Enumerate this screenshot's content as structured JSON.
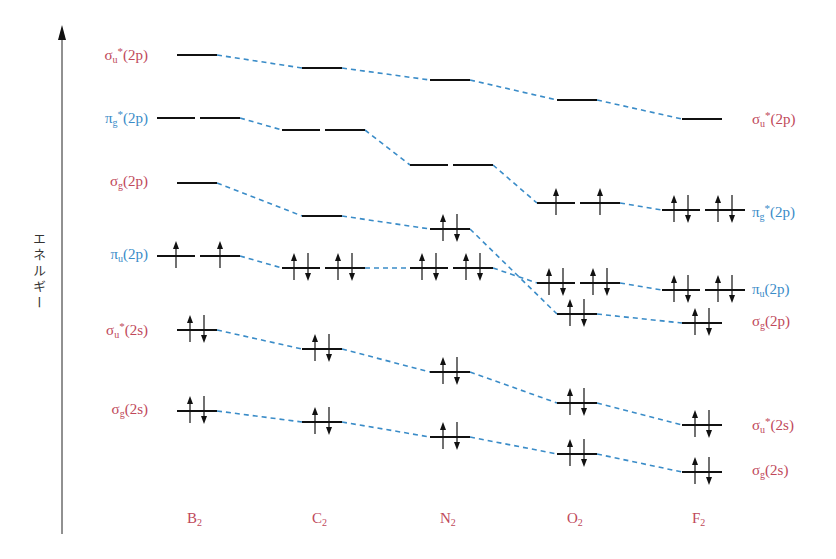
{
  "diagram": {
    "type": "molecular-orbital-energy-diagram",
    "y_axis_label": "エネルギー",
    "colors": {
      "sigma_label": "#c0485a",
      "pi_label": "#3a8cc8",
      "connector": "#3a8cc8",
      "level": "#111111"
    },
    "left_labels": [
      {
        "sym": "σ",
        "sub": "u",
        "star": "*",
        "orb": "(2p)",
        "color": "red",
        "y": 55
      },
      {
        "sym": "π",
        "sub": "g",
        "star": "*",
        "orb": "(2p)",
        "color": "blue",
        "y": 118
      },
      {
        "sym": "σ",
        "sub": "g",
        "star": "",
        "orb": "(2p)",
        "color": "red",
        "y": 183
      },
      {
        "sym": "π",
        "sub": "u",
        "star": "",
        "orb": "(2p)",
        "color": "blue",
        "y": 256
      },
      {
        "sym": "σ",
        "sub": "u",
        "star": "*",
        "orb": "(2s)",
        "color": "red",
        "y": 330
      },
      {
        "sym": "σ",
        "sub": "g",
        "star": "",
        "orb": "(2s)",
        "color": "red",
        "y": 411
      }
    ],
    "right_labels": [
      {
        "sym": "σ",
        "sub": "u",
        "star": "*",
        "orb": "(2p)",
        "color": "red",
        "y": 119
      },
      {
        "sym": "π",
        "sub": "g",
        "star": "*",
        "orb": "(2p)",
        "color": "blue",
        "y": 212
      },
      {
        "sym": "π",
        "sub": "u",
        "star": "",
        "orb": "(2p)",
        "color": "blue",
        "y": 291
      },
      {
        "sym": "σ",
        "sub": "g",
        "star": "",
        "orb": "(2p)",
        "color": "red",
        "y": 323
      },
      {
        "sym": "σ",
        "sub": "u",
        "star": "*",
        "orb": "(2s)",
        "color": "red",
        "y": 425
      },
      {
        "sym": "σ",
        "sub": "g",
        "star": "",
        "orb": "(2s)",
        "color": "red",
        "y": 472
      }
    ],
    "molecules": [
      {
        "name": "B",
        "sub": "2",
        "cx": 197,
        "levels": {
          "sigma_u_star_2p": {
            "y": 55,
            "e": []
          },
          "pi_g_star_2p": {
            "y": 118,
            "e": [
              [],
              []
            ]
          },
          "sigma_g_2p": {
            "y": 183,
            "e": []
          },
          "pi_u_2p": {
            "y": 256,
            "e": [
              [
                "up"
              ],
              [
                "up"
              ]
            ]
          },
          "sigma_u_star_2s": {
            "y": 330,
            "e": [
              "up",
              "down"
            ]
          },
          "sigma_g_2s": {
            "y": 411,
            "e": [
              "up",
              "down"
            ]
          }
        }
      },
      {
        "name": "C",
        "sub": "2",
        "cx": 322,
        "levels": {
          "sigma_u_star_2p": {
            "y": 68,
            "e": []
          },
          "pi_g_star_2p": {
            "y": 130,
            "e": [
              [],
              []
            ]
          },
          "sigma_g_2p": {
            "y": 216,
            "e": []
          },
          "pi_u_2p": {
            "y": 268,
            "e": [
              [
                "up",
                "down"
              ],
              [
                "up",
                "down"
              ]
            ]
          },
          "sigma_u_star_2s": {
            "y": 349,
            "e": [
              "up",
              "down"
            ]
          },
          "sigma_g_2s": {
            "y": 422,
            "e": [
              "up",
              "down"
            ]
          }
        }
      },
      {
        "name": "N",
        "sub": "2",
        "cx": 450,
        "levels": {
          "sigma_u_star_2p": {
            "y": 80,
            "e": []
          },
          "pi_g_star_2p": {
            "y": 165,
            "e": [
              [],
              []
            ]
          },
          "sigma_g_2p": {
            "y": 229,
            "e": [
              "up",
              "down"
            ]
          },
          "pi_u_2p": {
            "y": 268,
            "e": [
              [
                "up",
                "down"
              ],
              [
                "up",
                "down"
              ]
            ]
          },
          "sigma_u_star_2s": {
            "y": 372,
            "e": [
              "up",
              "down"
            ]
          },
          "sigma_g_2s": {
            "y": 437,
            "e": [
              "up",
              "down"
            ]
          }
        }
      },
      {
        "name": "O",
        "sub": "2",
        "cx": 577,
        "levels": {
          "sigma_u_star_2p": {
            "y": 100,
            "e": []
          },
          "pi_g_star_2p": {
            "y": 203,
            "e": [
              [
                "up"
              ],
              [
                "up"
              ]
            ]
          },
          "pi_u_2p": {
            "y": 283,
            "e": [
              [
                "up",
                "down"
              ],
              [
                "up",
                "down"
              ]
            ]
          },
          "sigma_g_2p": {
            "y": 314,
            "e": [
              "up",
              "down"
            ]
          },
          "sigma_u_star_2s": {
            "y": 403,
            "e": [
              "up",
              "down"
            ]
          },
          "sigma_g_2s": {
            "y": 454,
            "e": [
              "up",
              "down"
            ]
          }
        }
      },
      {
        "name": "F",
        "sub": "2",
        "cx": 702,
        "levels": {
          "sigma_u_star_2p": {
            "y": 119,
            "e": []
          },
          "pi_g_star_2p": {
            "y": 210,
            "e": [
              [
                "up",
                "down"
              ],
              [
                "up",
                "down"
              ]
            ]
          },
          "pi_u_2p": {
            "y": 290,
            "e": [
              [
                "up",
                "down"
              ],
              [
                "up",
                "down"
              ]
            ]
          },
          "sigma_g_2p": {
            "y": 323,
            "e": [
              "up",
              "down"
            ]
          },
          "sigma_u_star_2s": {
            "y": 425,
            "e": [
              "up",
              "down"
            ]
          },
          "sigma_g_2s": {
            "y": 472,
            "e": [
              "up",
              "down"
            ]
          }
        }
      }
    ]
  }
}
